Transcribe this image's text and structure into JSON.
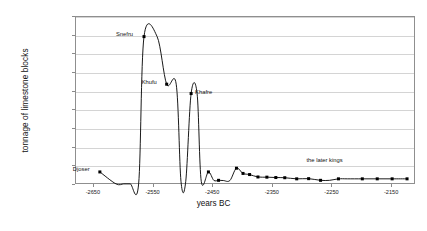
{
  "chart_data": {
    "type": "line",
    "title": "",
    "xlabel": "years BC",
    "ylabel": "tonnage of limestone blocks",
    "xlim": [
      -2680,
      -2110
    ],
    "ylim": [
      0,
      9000000
    ],
    "grid": true,
    "legend": false,
    "x_ticks": [
      "-2650",
      "-2550",
      "-2450",
      "-2350",
      "-2250",
      "-2150"
    ],
    "x_tick_values": [
      -2650,
      -2550,
      -2450,
      -2350,
      -2250,
      -2150
    ],
    "y_ticks": [
      "0.00",
      "1,000,000.00",
      "2,000,000.00",
      "3,000,000.00",
      "4,000,000.00",
      "5,000,000.00",
      "6,000,000.00",
      "7,000,000.00",
      "8,000,000.00",
      "9,000,000.00"
    ],
    "y_tick_values": [
      0,
      1000000,
      2000000,
      3000000,
      4000000,
      5000000,
      6000000,
      7000000,
      8000000,
      9000000
    ],
    "marker": "filled-square",
    "line_color": "#000000",
    "marker_color": "#000000",
    "series": [
      {
        "name": "tonnage of limestone blocks",
        "x": [
          -2640,
          -2613,
          -2600,
          -2589,
          -2575,
          -2566,
          -2544,
          -2528,
          -2512,
          -2504,
          -2496,
          -2487,
          -2477,
          -2470,
          -2458,
          -2449,
          -2441,
          -2433,
          -2422,
          -2411,
          -2400,
          -2389,
          -2375,
          -2360,
          -2345,
          -2330,
          -2310,
          -2290,
          -2270,
          -2255,
          -2240,
          -2225,
          -2200,
          -2175,
          -2150,
          -2125
        ],
        "y": [
          700000,
          60000,
          60000,
          60000,
          60000,
          7950000,
          7950000,
          5400000,
          5400000,
          200000,
          200000,
          4900000,
          4900000,
          200000,
          700000,
          250000,
          250000,
          240000,
          240000,
          900000,
          620000,
          560000,
          430000,
          420000,
          400000,
          390000,
          330000,
          340000,
          250000,
          250000,
          330000,
          330000,
          330000,
          330000,
          330000,
          330000
        ]
      }
    ],
    "annotations": [
      {
        "label": "Djoser",
        "x": -2640,
        "y": 700000
      },
      {
        "label": "Snefru",
        "x": -2566,
        "y": 7950000
      },
      {
        "label": "Khufu",
        "x": -2528,
        "y": 5400000
      },
      {
        "label": "Khafre",
        "x": -2487,
        "y": 4900000
      },
      {
        "label": "the later kings",
        "x": -2255,
        "y": 900000
      }
    ]
  }
}
